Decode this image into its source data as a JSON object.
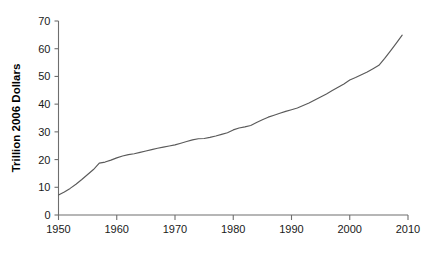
{
  "chart_data": {
    "type": "line",
    "title": "",
    "subtitle": "",
    "xlabel": "",
    "ylabel": "Trillion 2006 Dollars",
    "xlim": [
      1950,
      2010
    ],
    "ylim": [
      0,
      70
    ],
    "xticks": [
      1950,
      1960,
      1970,
      1980,
      1990,
      2000,
      2010
    ],
    "xtick_labels": [
      "1950",
      "1960",
      "1970",
      "1980",
      "1990",
      "2000",
      "2010"
    ],
    "yticks": [
      0,
      10,
      20,
      30,
      40,
      50,
      60,
      70
    ],
    "ytick_labels": [
      "0",
      "10",
      "20",
      "30",
      "40",
      "50",
      "60",
      "70"
    ],
    "grid": false,
    "legend": false,
    "legend_position": "none",
    "line_color": "#5a5a5a",
    "axis_color": "#6e6e6e",
    "series": [
      {
        "name": "World output",
        "x": [
          1950,
          1951,
          1952,
          1953,
          1954,
          1955,
          1956,
          1957,
          1958,
          1959,
          1960,
          1961,
          1962,
          1963,
          1964,
          1965,
          1966,
          1967,
          1968,
          1969,
          1970,
          1971,
          1972,
          1973,
          1974,
          1975,
          1976,
          1977,
          1978,
          1979,
          1980,
          1981,
          1982,
          1983,
          1984,
          1985,
          1986,
          1987,
          1988,
          1989,
          1990,
          1991,
          1992,
          1993,
          1994,
          1995,
          1996,
          1997,
          1998,
          1999,
          2000,
          2001,
          2002,
          2003,
          2004,
          2005,
          2006,
          2007,
          2008,
          2009
        ],
        "values": [
          7.2,
          8.3,
          9.6,
          11.1,
          12.8,
          14.6,
          16.4,
          18.7,
          19.1,
          19.8,
          20.6,
          21.3,
          21.8,
          22.1,
          22.6,
          23.1,
          23.6,
          24.1,
          24.5,
          24.9,
          25.3,
          25.9,
          26.5,
          27.1,
          27.5,
          27.6,
          28.0,
          28.5,
          29.1,
          29.7,
          30.7,
          31.4,
          31.8,
          32.3,
          33.4,
          34.4,
          35.3,
          36.0,
          36.7,
          37.4,
          38.0,
          38.6,
          39.5,
          40.4,
          41.5,
          42.6,
          43.7,
          44.9,
          46.1,
          47.3,
          48.7,
          49.6,
          50.6,
          51.6,
          52.8,
          54.0,
          56.5,
          59.2,
          62.0,
          64.9
        ]
      }
    ]
  },
  "axis": {
    "y_title": "Trillion 2006 Dollars"
  }
}
